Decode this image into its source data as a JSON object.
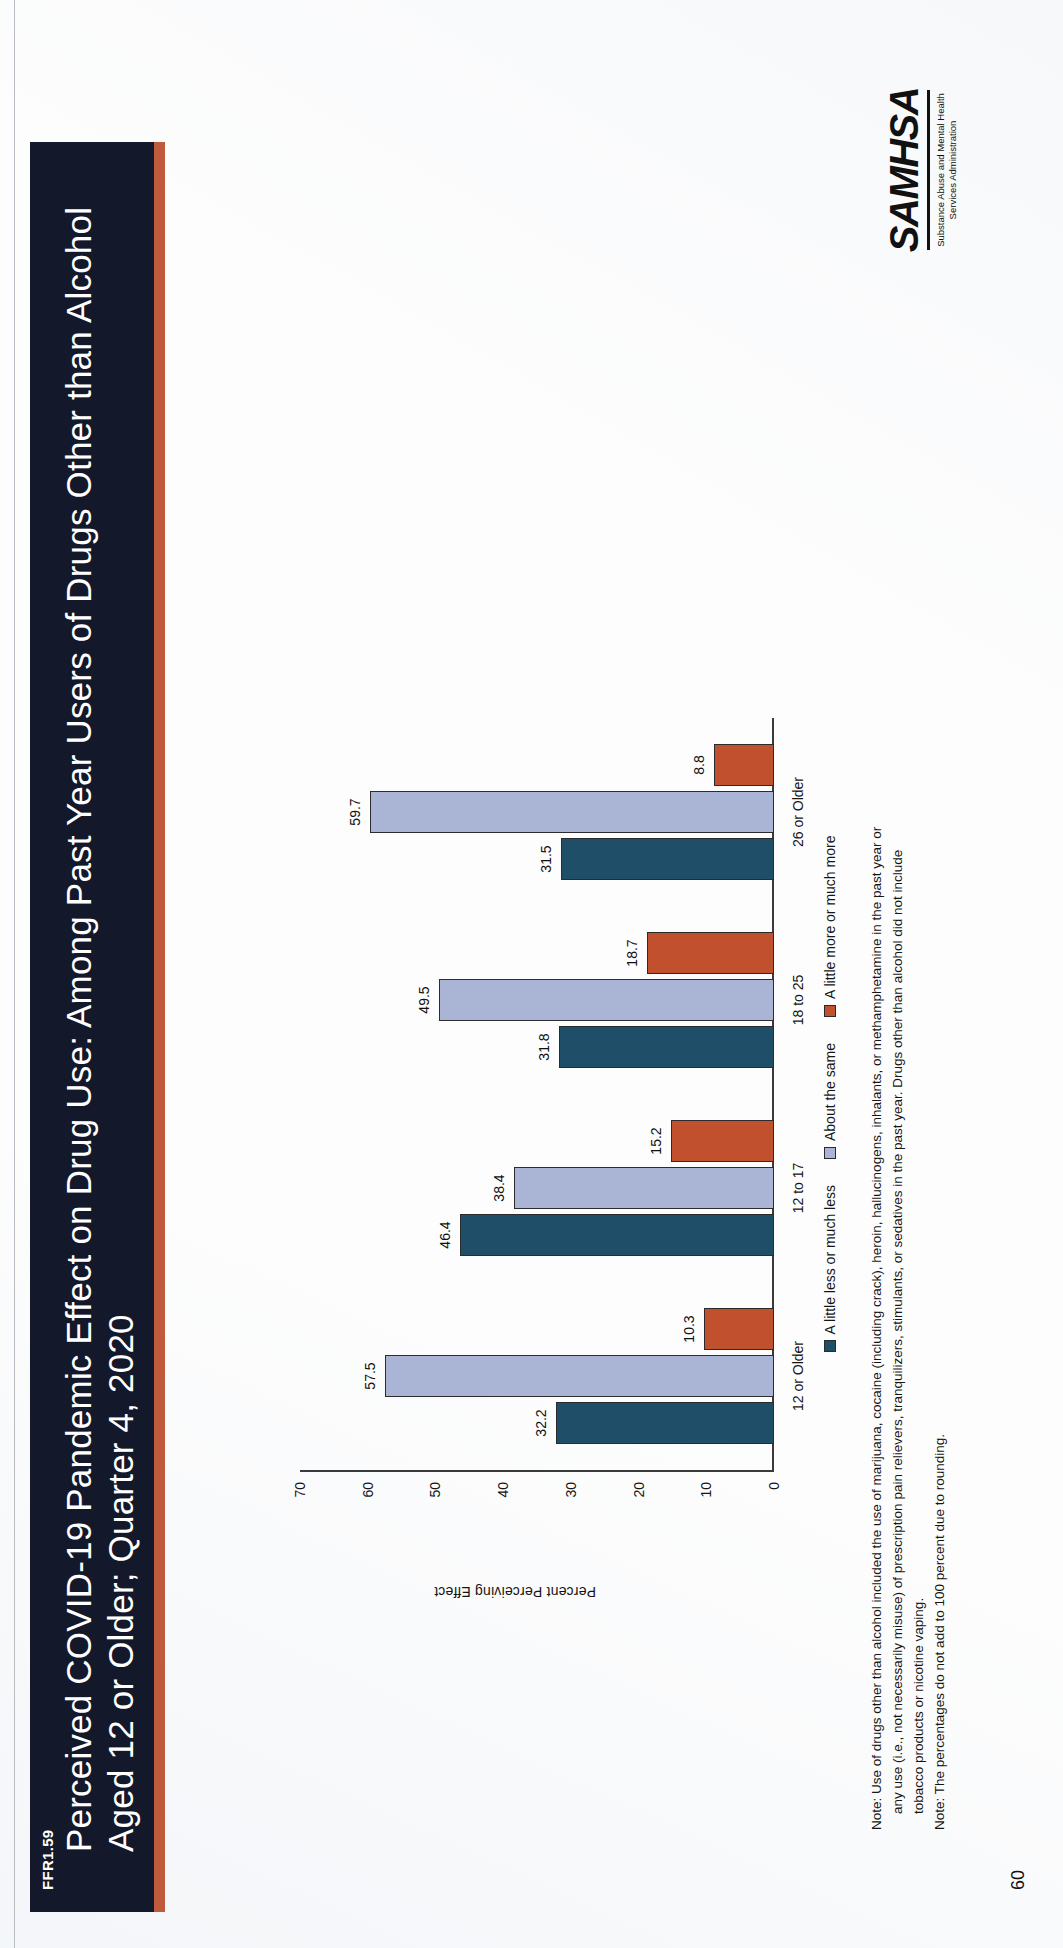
{
  "header": {
    "tag": "FFR1.59",
    "title": "Perceived COVID-19 Pandemic Effect on Drug Use: Among Past Year Users of Drugs Other than Alcohol Aged 12 or Older; Quarter 4, 2020",
    "band_color": "#14182b",
    "accent_color": "#c05a3c"
  },
  "chart_data": {
    "type": "bar",
    "title": "Perceived COVID-19 Pandemic Effect on Drug Use: Among Past Year Users of Drugs Other than Alcohol Aged 12 or Older; Quarter 4, 2020",
    "xlabel": "",
    "ylabel": "Percent Perceiving Effect",
    "ylim": [
      0,
      70
    ],
    "yticks": [
      0,
      10,
      20,
      30,
      40,
      50,
      60,
      70
    ],
    "grid": false,
    "legend_position": "bottom",
    "categories": [
      "12 or Older",
      "12 to 17",
      "18 to 25",
      "26 or Older"
    ],
    "series": [
      {
        "name": "A little less or much less",
        "color": "#1f4e68",
        "values": [
          32.2,
          46.4,
          31.8,
          31.5
        ]
      },
      {
        "name": "About the same",
        "color": "#aab4d4",
        "values": [
          57.5,
          38.4,
          49.5,
          59.7
        ]
      },
      {
        "name": "A little more or much more",
        "color": "#c1512e",
        "values": [
          10.3,
          15.2,
          18.7,
          8.8
        ]
      }
    ]
  },
  "notes": {
    "line1": "Note: Use of drugs other than alcohol included the use of marijuana, cocaine (including crack), heroin, hallucinogens, inhalants, or methamphetamine in the past year or",
    "line2": "any use (i.e., not necessarily misuse) of prescription pain relievers, tranquilizers, stimulants, or sedatives in the past year. Drugs other than alcohol did not include",
    "line3": "tobacco products or nicotine vaping.",
    "line4": "Note: The percentages do not add to 100 percent due to rounding."
  },
  "logo": {
    "wordmark": "SAMHSA",
    "subtitle_line1": "Substance Abuse and Mental Health",
    "subtitle_line2": "Services Administration"
  },
  "footer": {
    "page_number": "60"
  }
}
